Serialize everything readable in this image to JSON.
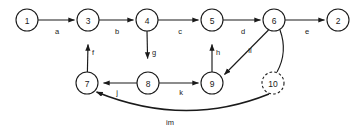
{
  "figure": {
    "kind": "directed-graph-diagram",
    "background_color": "#ffffff",
    "stroke_color": "#1a1a1a",
    "width": 361,
    "height": 131
  },
  "nodes": [
    {
      "id": "1",
      "label": "1",
      "cx": 27,
      "cy": 20,
      "r": 11,
      "style": "solid"
    },
    {
      "id": "3",
      "label": "3",
      "cx": 88,
      "cy": 20,
      "r": 11,
      "style": "solid"
    },
    {
      "id": "4",
      "label": "4",
      "cx": 147,
      "cy": 20,
      "r": 11,
      "style": "solid"
    },
    {
      "id": "5",
      "label": "5",
      "cx": 212,
      "cy": 20,
      "r": 11,
      "style": "solid"
    },
    {
      "id": "6",
      "label": "6",
      "cx": 274,
      "cy": 20,
      "r": 11,
      "style": "solid"
    },
    {
      "id": "2",
      "label": "2",
      "cx": 338,
      "cy": 20,
      "r": 11,
      "style": "solid"
    },
    {
      "id": "7",
      "label": "7",
      "cx": 87,
      "cy": 83,
      "r": 11,
      "style": "solid"
    },
    {
      "id": "8",
      "label": "8",
      "cx": 148,
      "cy": 83,
      "r": 11,
      "style": "solid"
    },
    {
      "id": "9",
      "label": "9",
      "cx": 212,
      "cy": 83,
      "r": 11,
      "style": "solid"
    },
    {
      "id": "10",
      "label": "10",
      "cx": 273,
      "cy": 83,
      "r": 11,
      "style": "dashed"
    }
  ],
  "edges": [
    {
      "id": "a",
      "from": "1",
      "to": "3",
      "label": "a",
      "label_x": 57,
      "label_y": 31
    },
    {
      "id": "b",
      "from": "3",
      "to": "4",
      "label": "b",
      "label_x": 117,
      "label_y": 31
    },
    {
      "id": "c",
      "from": "4",
      "to": "5",
      "label": "c",
      "label_x": 180,
      "label_y": 31
    },
    {
      "id": "d",
      "from": "5",
      "to": "6",
      "label": "d",
      "label_x": 243,
      "label_y": 31
    },
    {
      "id": "e",
      "from": "6",
      "to": "2",
      "label": "e",
      "label_x": 307,
      "label_y": 31
    },
    {
      "id": "f",
      "from": "7",
      "to": "3",
      "label": "f",
      "label_x": 93,
      "label_y": 52
    },
    {
      "id": "g",
      "from": "4",
      "to": "8",
      "label": "g",
      "label_x": 154,
      "label_y": 52
    },
    {
      "id": "h",
      "from": "9",
      "to": "5",
      "label": "h",
      "label_x": 218,
      "label_y": 52
    },
    {
      "id": "j",
      "from": "8",
      "to": "7",
      "label": "j",
      "label_x": 117,
      "label_y": 92
    },
    {
      "id": "k",
      "from": "8",
      "to": "9",
      "label": "k",
      "label_x": 181,
      "label_y": 92
    },
    {
      "id": "il",
      "from": "6",
      "to": "9",
      "label": "il",
      "label_x": 250,
      "label_y": 50
    },
    {
      "id": "n",
      "from": "6",
      "to": "10",
      "label": "",
      "label_x": 0,
      "label_y": 0
    },
    {
      "id": "im",
      "from": "10",
      "to": "7",
      "label": "im",
      "label_x": 170,
      "label_y": 122
    }
  ]
}
